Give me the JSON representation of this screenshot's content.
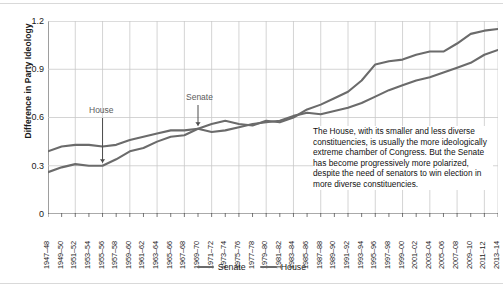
{
  "chart_data": {
    "type": "line",
    "title": "",
    "xlabel": "",
    "ylabel": "Difference in Party Ideology",
    "ylim": [
      0,
      1.2
    ],
    "yticks": [
      0,
      0.3,
      0.6,
      0.9,
      1.2
    ],
    "ytick_labels": [
      "0",
      "0.3",
      "0.6",
      "0.9",
      "1.2"
    ],
    "grid": "both",
    "legend_position": "bottom-center",
    "categories": [
      "1947–48",
      "1949–50",
      "1951–52",
      "1953–54",
      "1955–56",
      "1957–58",
      "1959–60",
      "1961–62",
      "1963–64",
      "1965–66",
      "1967–68",
      "1969–70",
      "1971–72",
      "1973–74",
      "1975–76",
      "1977–78",
      "1979–80",
      "1981–82",
      "1983–84",
      "1985–86",
      "1987–88",
      "1989–90",
      "1991–92",
      "1993–94",
      "1995–96",
      "1997–98",
      "1999–00",
      "2001–02",
      "2003–04",
      "2005–06",
      "2007–08",
      "2009–10",
      "2011–12",
      "2013–14"
    ],
    "series": [
      {
        "name": "Senate",
        "color": "#6b6b6b",
        "values": [
          0.39,
          0.42,
          0.43,
          0.43,
          0.42,
          0.43,
          0.46,
          0.48,
          0.5,
          0.52,
          0.52,
          0.53,
          0.51,
          0.52,
          0.54,
          0.56,
          0.57,
          0.58,
          0.61,
          0.63,
          0.62,
          0.64,
          0.66,
          0.69,
          0.73,
          0.77,
          0.8,
          0.83,
          0.85,
          0.88,
          0.91,
          0.94,
          0.99,
          1.02
        ]
      },
      {
        "name": "House",
        "color": "#6b6b6b",
        "values": [
          0.26,
          0.29,
          0.31,
          0.3,
          0.3,
          0.34,
          0.39,
          0.41,
          0.45,
          0.48,
          0.49,
          0.53,
          0.56,
          0.58,
          0.56,
          0.55,
          0.58,
          0.57,
          0.6,
          0.65,
          0.68,
          0.72,
          0.76,
          0.83,
          0.93,
          0.95,
          0.96,
          0.99,
          1.01,
          1.01,
          1.06,
          1.12,
          1.14,
          1.15
        ]
      }
    ],
    "annotations": [
      {
        "name": "house-callout",
        "text": "House",
        "points_to_category": "1955–56",
        "points_to_series": "House"
      },
      {
        "name": "senate-callout",
        "text": "Senate",
        "points_to_category": "1969–70",
        "points_to_series": "Senate"
      },
      {
        "name": "note",
        "text": "The House, with its smaller and less diverse constituencies, is usually the more ideologically extreme chamber of Congress. But the Senate has become progressively more polarized, despite the need of senators to win election in more diverse constituencies."
      }
    ]
  },
  "legend": {
    "items": [
      {
        "label": "Senate"
      },
      {
        "label": "House"
      }
    ]
  }
}
